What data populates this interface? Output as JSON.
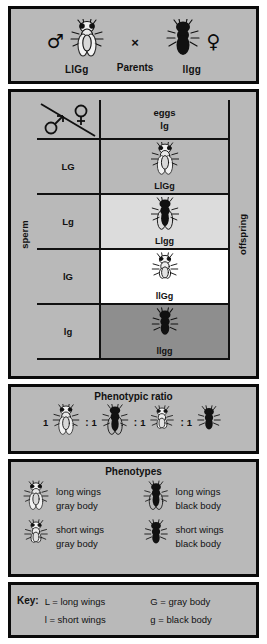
{
  "parents": {
    "section_label": "Parents",
    "cross_symbol": "×",
    "male": {
      "sex_symbol": "♂",
      "sex_name": "male",
      "genotype": "LlGg",
      "fly_style": "gray-long"
    },
    "female": {
      "sex_symbol": "♀",
      "sex_name": "female",
      "genotype": "llgg",
      "fly_style": "black-short"
    }
  },
  "punnett": {
    "sperm_label": "sperm",
    "offspring_label": "offspring",
    "eggs_label": "eggs",
    "corner_male_symbol": "♂",
    "corner_female_symbol": "♀",
    "egg_gametes": [
      "lg"
    ],
    "sperm_gametes": [
      "LG",
      "Lg",
      "lG",
      "lg"
    ],
    "cells": [
      {
        "genotype": "LlGg",
        "bg": "#b9b9b9",
        "fly_style": "gray-long"
      },
      {
        "genotype": "Llgg",
        "bg": "#dcdcdc",
        "fly_style": "black-long"
      },
      {
        "genotype": "llGg",
        "bg": "#ffffff",
        "fly_style": "gray-short"
      },
      {
        "genotype": "llgg",
        "bg": "#8e8e8e",
        "fly_style": "black-short"
      }
    ]
  },
  "ratio": {
    "title": "Phenotypic ratio",
    "separator": ":",
    "items": [
      {
        "count": "1",
        "fly_style": "gray-long"
      },
      {
        "count": "1",
        "fly_style": "black-long"
      },
      {
        "count": "1",
        "fly_style": "gray-short"
      },
      {
        "count": "1",
        "fly_style": "black-short"
      }
    ]
  },
  "phenotypes": {
    "title": "Phenotypes",
    "items": [
      {
        "line1": "long wings",
        "line2": "gray body",
        "fly_style": "gray-long"
      },
      {
        "line1": "long wings",
        "line2": "black body",
        "fly_style": "black-long"
      },
      {
        "line1": "short wings",
        "line2": "gray body",
        "fly_style": "gray-short"
      },
      {
        "line1": "short wings",
        "line2": "black body",
        "fly_style": "black-short"
      }
    ]
  },
  "key": {
    "title": "Key:",
    "entries": [
      "L  =  long wings",
      "G  =  gray body",
      "l  =  short wings",
      "g  =  black body"
    ]
  },
  "colors": {
    "panel_bg": "#b9b9b9",
    "border": "#0a0a0a",
    "cell_light": "#dcdcdc",
    "cell_white": "#ffffff",
    "cell_dark": "#8e8e8e"
  }
}
